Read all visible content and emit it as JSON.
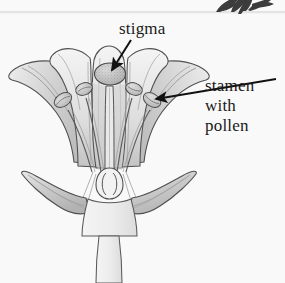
{
  "page": {
    "background_color": "#f9f9f9",
    "width": 285,
    "height": 283
  },
  "decoration": {
    "top_rule": {
      "name": "horizontal-rule",
      "color": "#dcdcdc",
      "y": 12
    },
    "leaf_sprig": {
      "name": "leaf-sprig-decoration",
      "color": "#3a3a3a",
      "position": "top-right"
    }
  },
  "labels": [
    {
      "id": "stigma",
      "text": "stigma",
      "lines": [
        "stigma"
      ],
      "color": "#1a1a1a",
      "x": 119,
      "y": 19,
      "arrow": {
        "from_x": 128,
        "from_y": 41,
        "to_x": 110,
        "to_y": 73,
        "color": "#111111"
      }
    },
    {
      "id": "stamen_with_pollen",
      "text": "stamen with pollen",
      "lines": [
        "stamen",
        "with",
        "pollen"
      ],
      "color": "#1a1a1a",
      "x": 205,
      "y": 76,
      "arrow": {
        "from_x": 272,
        "from_y": 80,
        "to_x": 153,
        "to_y": 100,
        "color": "#111111"
      }
    }
  ],
  "diagram": {
    "name": "flower-longitudinal-section",
    "parts": [
      {
        "name": "petal-outer-left",
        "label": "petal"
      },
      {
        "name": "petal-outer-right",
        "label": "petal"
      },
      {
        "name": "petal-inner-left",
        "label": "petal"
      },
      {
        "name": "petal-inner-right",
        "label": "petal"
      },
      {
        "name": "petal-center",
        "label": "petal"
      },
      {
        "name": "sepal-left",
        "label": "sepal"
      },
      {
        "name": "sepal-right",
        "label": "sepal"
      },
      {
        "name": "stigma",
        "label": "stigma"
      },
      {
        "name": "style",
        "label": "style"
      },
      {
        "name": "ovary",
        "label": "ovary"
      },
      {
        "name": "ovule-left",
        "label": "ovule"
      },
      {
        "name": "ovule-right",
        "label": "ovule"
      },
      {
        "name": "stamen-1",
        "label": "stamen with pollen"
      },
      {
        "name": "stamen-2",
        "label": "stamen with pollen"
      },
      {
        "name": "stamen-3",
        "label": "stamen with pollen"
      },
      {
        "name": "stamen-4",
        "label": "stamen with pollen"
      },
      {
        "name": "receptacle",
        "label": "receptacle"
      },
      {
        "name": "stem",
        "label": "stem"
      }
    ],
    "colors": {
      "outline": "#4a4a4a",
      "petal_light": "#f2f2f2",
      "petal_mid": "#d8d8d8",
      "petal_shade": "#b9b9b9",
      "anther_fill": "#d3d3d3",
      "stigma_fill": "#c9c9c9",
      "stem_fill": "#efefef"
    }
  }
}
